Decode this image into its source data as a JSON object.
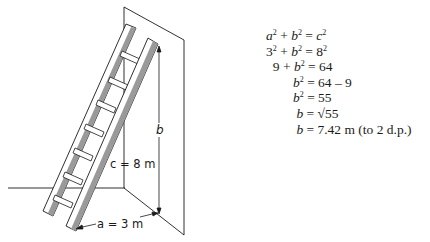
{
  "diagram": {
    "labels": {
      "hypotenuse": "c = 8 m",
      "base": "a = 3 m",
      "height": "b"
    },
    "colors": {
      "stroke": "#1a1a1a",
      "rail_shade": "#9a9a9a"
    }
  },
  "working": {
    "lines": [
      {
        "lhs": "a² + b²",
        "rhs": "= c²"
      },
      {
        "lhs": "3² + b²",
        "rhs": "= 8²"
      },
      {
        "lhs": "9 + b²",
        "rhs": "= 64"
      },
      {
        "lhs": "b²",
        "rhs": "= 64 − 9"
      },
      {
        "lhs": "b²",
        "rhs": "= 55"
      },
      {
        "lhs": "b",
        "rhs": "= √55"
      },
      {
        "lhs": "b",
        "rhs": "= 7.42 m (to 2 d.p.)"
      }
    ]
  }
}
